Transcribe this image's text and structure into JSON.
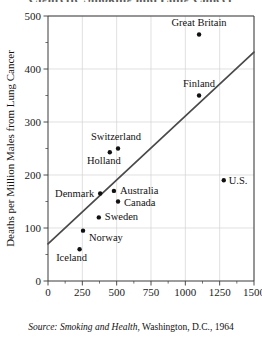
{
  "figure": {
    "title_sliver": "Cigarette Smoking and Lung Cancer",
    "source_prefix": "Source:",
    "source_italic": "Smoking and Health",
    "source_rest": ", Washington, D.C., 1964"
  },
  "axes": {
    "x_title_line1": "Annual Cigarette Consumption",
    "x_title_line2": "for Each Adult Male",
    "y_title": "Deaths per Million Males from Lung Cancer",
    "x_ticks": [
      "0",
      "250",
      "500",
      "750",
      "1000",
      "1250",
      "1500"
    ],
    "y_ticks": [
      "0",
      "100",
      "200",
      "300",
      "400",
      "500"
    ]
  },
  "chart_data": {
    "type": "scatter",
    "title": "Cigarette Smoking and Lung Cancer",
    "xlabel": "Annual Cigarette Consumption for Each Adult Male",
    "ylabel": "Deaths per Million Males from Lung Cancer",
    "xlim": [
      0,
      1500
    ],
    "ylim": [
      0,
      500
    ],
    "xticks": [
      0,
      250,
      500,
      750,
      1000,
      1250,
      1500
    ],
    "yticks": [
      0,
      100,
      200,
      300,
      400,
      500
    ],
    "xminor_step": 125,
    "yminor_step": 50,
    "grid": true,
    "legend": "none",
    "source": "Source: Smoking and Health, Washington, D.C., 1964",
    "points": [
      {
        "name": "Great Britain",
        "x": 1100,
        "y": 465,
        "label_dx": 0,
        "label_dy": -9,
        "label_anchor": "middle"
      },
      {
        "name": "Finland",
        "x": 1100,
        "y": 350,
        "label_dx": 0,
        "label_dy": -9,
        "label_anchor": "middle"
      },
      {
        "name": "Switzerland",
        "x": 510,
        "y": 250,
        "label_dx": -2,
        "label_dy": -9,
        "label_anchor": "middle"
      },
      {
        "name": "Holland",
        "x": 450,
        "y": 243,
        "label_dx": -6,
        "label_dy": 12,
        "label_anchor": "middle"
      },
      {
        "name": "Denmark",
        "x": 380,
        "y": 165,
        "label_dx": -6,
        "label_dy": 3,
        "label_anchor": "end"
      },
      {
        "name": "Australia",
        "x": 480,
        "y": 170,
        "label_dx": 6,
        "label_dy": 3,
        "label_anchor": "start"
      },
      {
        "name": "Canada",
        "x": 510,
        "y": 150,
        "label_dx": 6,
        "label_dy": 4,
        "label_anchor": "start"
      },
      {
        "name": "Sweden",
        "x": 370,
        "y": 120,
        "label_dx": 6,
        "label_dy": 3,
        "label_anchor": "start"
      },
      {
        "name": "Norway",
        "x": 255,
        "y": 95,
        "label_dx": 6,
        "label_dy": 10,
        "label_anchor": "start"
      },
      {
        "name": "Iceland",
        "x": 230,
        "y": 60,
        "label_dx": -8,
        "label_dy": 12,
        "label_anchor": "middle"
      },
      {
        "name": "U.S.",
        "x": 1280,
        "y": 190,
        "label_dx": 5,
        "label_dy": 4,
        "label_anchor": "start"
      }
    ],
    "trend_line": {
      "type": "linear-fit",
      "x_start": 0,
      "y_start": 70,
      "x_end": 1500,
      "y_end": 432
    }
  }
}
